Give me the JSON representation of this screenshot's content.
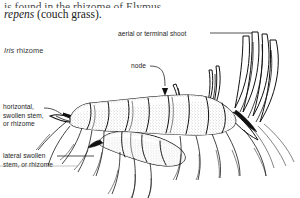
{
  "page": {
    "background_color": "#ffffff",
    "ink_color": "#121212",
    "figure_type": "botanical line illustration"
  },
  "body_text": {
    "clipped_line": "is found in the rhizome of Elymus",
    "line_italic": "repens",
    "line_rest": " (couch grass)."
  },
  "caption": {
    "italic_part": "Iris",
    "rest": " rhizome"
  },
  "labels": [
    {
      "id": "aerial",
      "text": "aerial or terminal shoot",
      "lines": [
        "aerial or terminal shoot"
      ],
      "leader": "straight-right"
    },
    {
      "id": "node",
      "text": "node",
      "lines": [
        "node"
      ],
      "leader": "curved-down-arrow"
    },
    {
      "id": "horizontal",
      "text": "horizontal, swollen stem, or rhizome",
      "lines": [
        "horizontal,",
        "swollen stem,",
        "or rhizome"
      ],
      "leader": "right-arrow"
    },
    {
      "id": "lateral",
      "text": "lateral swollen stem, or rhizome",
      "lines": [
        "lateral swollen",
        "stem, or rhizome"
      ],
      "leader": "straight-right"
    }
  ]
}
